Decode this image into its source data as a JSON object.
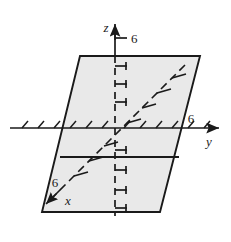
{
  "figure": {
    "type": "3d-coordinate-diagram",
    "background_color": "#ffffff",
    "plane": {
      "name": "shaded-plane",
      "fill_color": "#e8e8e8",
      "stroke_color": "#1a1a1a",
      "corners": [
        {
          "x": 80,
          "y": 56
        },
        {
          "x": 200,
          "y": 56
        },
        {
          "x": 160,
          "y": 212
        },
        {
          "x": 42,
          "y": 212
        }
      ],
      "trace_line": {
        "name": "horizontal-trace-line",
        "x1": 60,
        "y1": 157,
        "x2": 179,
        "y2": 157,
        "stroke_color": "#1a1a1a"
      }
    },
    "axes": [
      {
        "id": "z",
        "label": "z",
        "label_x": 106,
        "label_y": 32,
        "tick_label": "6",
        "tick_label_x": 131,
        "tick_label_y": 43,
        "direction": "up",
        "stroke_color": "#1a1a1a",
        "solid_from": {
          "x": 115,
          "y": 22
        },
        "solid_to": {
          "x": 115,
          "y": 56
        },
        "dashed_from": {
          "x": 115,
          "y": 56
        },
        "dashed_to": {
          "x": 115,
          "y": 212
        },
        "arrow_tip": {
          "x": 115,
          "y": 22
        }
      },
      {
        "id": "y",
        "label": "y",
        "label_x": 209,
        "label_y": 146,
        "tick_label": "6",
        "tick_label_x": 191,
        "tick_label_y": 123,
        "direction": "right",
        "stroke_color": "#1a1a1a",
        "solid_from": {
          "x": 10,
          "y": 128
        },
        "solid_to": {
          "x": 221,
          "y": 128
        },
        "arrow_tip": {
          "x": 221,
          "y": 128
        }
      },
      {
        "id": "x",
        "label": "x",
        "label_x": 68,
        "label_y": 205,
        "tick_label": "6",
        "tick_label_x": 55,
        "tick_label_y": 187,
        "direction": "down-left",
        "stroke_color": "#1a1a1a",
        "dashed_from": {
          "x": 185,
          "y": 65
        },
        "dashed_to": {
          "x": 46,
          "y": 204
        },
        "arrow_tip": {
          "x": 44,
          "y": 206
        }
      }
    ],
    "origin": {
      "x": 115,
      "y": 128
    }
  }
}
